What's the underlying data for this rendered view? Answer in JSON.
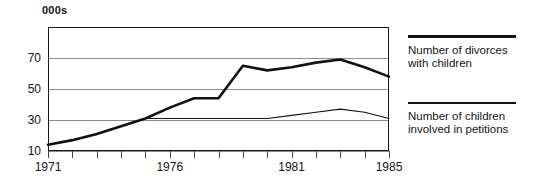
{
  "chart_data": {
    "type": "line",
    "title": "000s",
    "xlabel": "",
    "ylabel": "",
    "x": [
      1971,
      1972,
      1973,
      1974,
      1975,
      1976,
      1977,
      1978,
      1979,
      1980,
      1981,
      1982,
      1983,
      1984,
      1985
    ],
    "xlim": [
      1971,
      1985
    ],
    "ylim": [
      10,
      90
    ],
    "yticks": [
      10,
      30,
      50,
      70
    ],
    "ytick_labels": [
      "10",
      "30",
      "50",
      "70"
    ],
    "xticks": [
      1971,
      1972,
      1973,
      1974,
      1975,
      1976,
      1977,
      1978,
      1979,
      1980,
      1981,
      1982,
      1983,
      1984,
      1985
    ],
    "xtick_labels_shown": [
      "1971",
      "1976",
      "1981",
      "1985"
    ],
    "xtick_labels_shown_at": [
      1971,
      1976,
      1981,
      1985
    ],
    "grid": true,
    "grid_axis": "y",
    "legend_position": "right",
    "series": [
      {
        "name": "Number of divorces with children",
        "style": "thick",
        "values": [
          14,
          17,
          21,
          26,
          31,
          38,
          44,
          44,
          65,
          62,
          64,
          67,
          69,
          64,
          58
        ]
      },
      {
        "name": "Number of children involved in petitions",
        "style": "thin",
        "values": [
          14,
          17,
          21,
          26,
          31,
          31,
          31,
          31,
          31,
          31,
          33,
          35,
          37,
          35,
          31
        ]
      }
    ]
  },
  "legend": {
    "entries": [
      {
        "label": "Number of divorces with children"
      },
      {
        "label": "Number of children involved in petitions"
      }
    ]
  }
}
